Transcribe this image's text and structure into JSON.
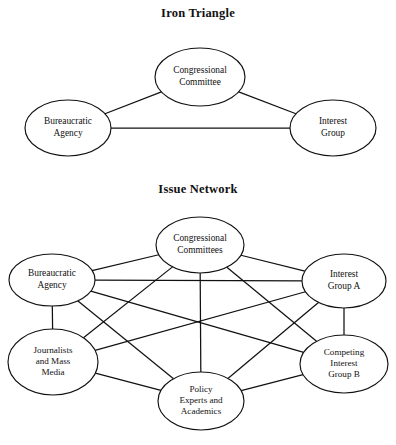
{
  "page": {
    "background": "#ffffff",
    "ink": "#111111",
    "width": 396,
    "height": 445
  },
  "figures": [
    {
      "id": "iron-triangle",
      "title": "Iron Triangle",
      "nodes": [
        {
          "id": "congressional-committee",
          "label": [
            "Congressional",
            "Committee"
          ],
          "cx": 200,
          "cy": 77,
          "rx": 45,
          "ry": 29
        },
        {
          "id": "bureaucratic-agency",
          "label": [
            "Bureaucratic",
            "Agency"
          ],
          "cx": 68,
          "cy": 128,
          "rx": 43,
          "ry": 28
        },
        {
          "id": "interest-group",
          "label": [
            "Interest",
            "Group"
          ],
          "cx": 333,
          "cy": 128,
          "rx": 43,
          "ry": 28
        }
      ],
      "edges": [
        {
          "from": "bureaucratic-agency",
          "to": "congressional-committee"
        },
        {
          "from": "congressional-committee",
          "to": "interest-group"
        },
        {
          "from": "bureaucratic-agency",
          "to": "interest-group"
        }
      ]
    },
    {
      "id": "issue-network",
      "title": "Issue Network",
      "nodes": [
        {
          "id": "congressional-committees",
          "label": [
            "Congressional",
            "Committees"
          ],
          "cx": 200,
          "cy": 245,
          "rx": 44,
          "ry": 28
        },
        {
          "id": "bureaucratic-agency-2",
          "label": [
            "Bureaucratic",
            "Agency"
          ],
          "cx": 52,
          "cy": 280,
          "rx": 43,
          "ry": 26
        },
        {
          "id": "interest-group-a",
          "label": [
            "Interest",
            "Group A"
          ],
          "cx": 344,
          "cy": 281,
          "rx": 42,
          "ry": 27
        },
        {
          "id": "journalists-mass-media",
          "label": [
            "Journalists",
            "and Mass",
            "Media"
          ],
          "cx": 53,
          "cy": 362,
          "rx": 45,
          "ry": 33
        },
        {
          "id": "competing-interest-group-b",
          "label": [
            "Competing",
            "Interest",
            "Group B"
          ],
          "cx": 344,
          "cy": 364,
          "rx": 44,
          "ry": 29
        },
        {
          "id": "policy-experts-academics",
          "label": [
            "Policy",
            "Experts and",
            "Academics"
          ],
          "cx": 201,
          "cy": 401,
          "rx": 43,
          "ry": 29
        }
      ],
      "edges": [
        {
          "from": "bureaucratic-agency-2",
          "to": "congressional-committees"
        },
        {
          "from": "congressional-committees",
          "to": "interest-group-a"
        },
        {
          "from": "bureaucratic-agency-2",
          "to": "journalists-mass-media"
        },
        {
          "from": "interest-group-a",
          "to": "competing-interest-group-b"
        },
        {
          "from": "congressional-committees",
          "to": "policy-experts-academics"
        },
        {
          "from": "congressional-committees",
          "to": "journalists-mass-media"
        },
        {
          "from": "congressional-committees",
          "to": "competing-interest-group-b"
        },
        {
          "from": "bureaucratic-agency-2",
          "to": "interest-group-a"
        },
        {
          "from": "bureaucratic-agency-2",
          "to": "competing-interest-group-b"
        },
        {
          "from": "bureaucratic-agency-2",
          "to": "policy-experts-academics"
        },
        {
          "from": "journalists-mass-media",
          "to": "interest-group-a"
        },
        {
          "from": "journalists-mass-media",
          "to": "policy-experts-academics"
        },
        {
          "from": "interest-group-a",
          "to": "policy-experts-academics"
        },
        {
          "from": "competing-interest-group-b",
          "to": "policy-experts-academics"
        }
      ]
    }
  ],
  "caption": {
    "text": ""
  }
}
